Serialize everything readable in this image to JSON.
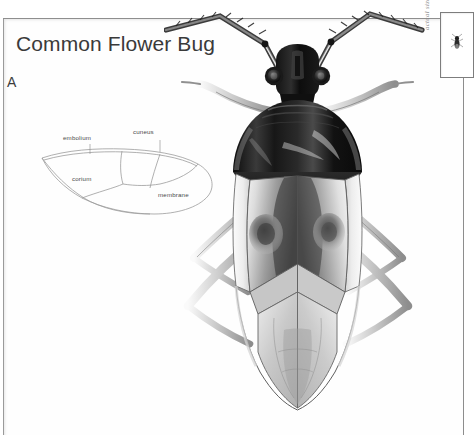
{
  "page": {
    "title": "Common Flower Bug",
    "panel_letter": "A"
  },
  "wing_diagram": {
    "name": "hemelytron-diagram",
    "labels": {
      "embolium": "embolium",
      "cuneus": "cuneus",
      "corium": "corium",
      "membrane": "membrane"
    }
  },
  "inset": {
    "caption": "actual size",
    "icon": "tiny-bug-icon"
  },
  "illustration": {
    "icon": "flower-bug-dorsal-illustration"
  },
  "colors": {
    "page_background": "#ffffff",
    "frame_line": "#8e8e8e",
    "title_text": "#3a3a3a",
    "label_text": "#4a4a4a",
    "caption_text": "#8a8a8a",
    "ink_dark": "#1a1a1a",
    "ink_mid": "#8f8f8f",
    "ink_light": "#d8d8d8"
  }
}
